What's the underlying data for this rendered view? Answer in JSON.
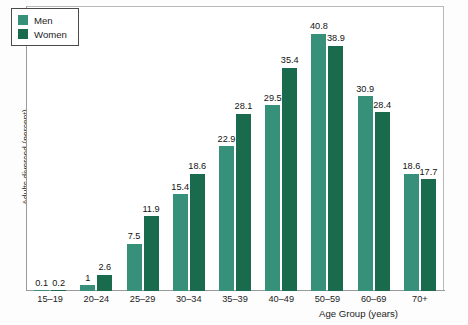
{
  "chart_data": {
    "type": "bar",
    "title": "",
    "subtitle": "",
    "xlabel": "Age Group (years)",
    "ylabel": "Adults divorced (percent)",
    "categories": [
      "15–19",
      "20–24",
      "25–29",
      "30–34",
      "35–39",
      "40–49",
      "50–59",
      "60–69",
      "70+"
    ],
    "series": [
      {
        "name": "Men",
        "color": "#37907a",
        "values": [
          0.1,
          1,
          7.5,
          15.4,
          22.9,
          29.5,
          40.8,
          30.9,
          18.6
        ],
        "labels": [
          "0.1",
          "1",
          "7.5",
          "15.4",
          "22.9",
          "29.5",
          "40.8",
          "30.9",
          "18.6"
        ]
      },
      {
        "name": "Women",
        "color": "#1a6b4e",
        "values": [
          0.2,
          2.6,
          11.9,
          18.6,
          28.1,
          35.4,
          38.9,
          28.4,
          17.7
        ],
        "labels": [
          "0.2",
          "2.6",
          "11.9",
          "18.6",
          "28.1",
          "35.4",
          "38.9",
          "28.4",
          "17.7"
        ]
      }
    ],
    "ylim": [
      0,
      45
    ],
    "xlim_categories": 9,
    "grid": false,
    "yticks": [],
    "legend_position": "upper-left",
    "legend_entries": [
      "Men",
      "Women"
    ],
    "annotations": "Every bar is annotated with its value above the bar top."
  },
  "legend": {
    "items": [
      {
        "label": "Men",
        "color": "#37907a"
      },
      {
        "label": "Women",
        "color": "#1a6b4e"
      }
    ]
  }
}
